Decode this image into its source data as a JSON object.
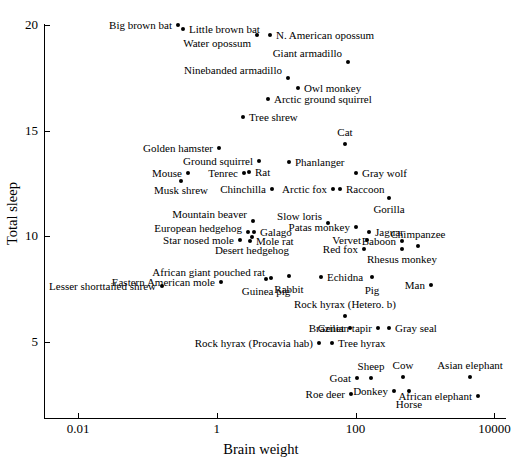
{
  "chart_data": {
    "type": "scatter",
    "title": "",
    "xlabel": "Brain weight",
    "ylabel": "Total sleep",
    "xscale": "log",
    "yscale": "linear",
    "xlim": [
      0.0018,
      12000
    ],
    "ylim": [
      2.5,
      20.5
    ],
    "grid": false,
    "legend": null,
    "xticks": [
      "0.01",
      "1",
      "100",
      "10000"
    ],
    "xtick_values": [
      0.01,
      1,
      100,
      10000
    ],
    "yticks": [
      "20",
      "15",
      "10",
      "5"
    ],
    "ytick_values": [
      20,
      15,
      10,
      5
    ],
    "points": [
      {
        "label": "Big brown bat",
        "x": 0.3,
        "y": 19.9,
        "px": 178,
        "py": 25,
        "lx": 172,
        "ly": 25,
        "lpos": "left"
      },
      {
        "label": "Little brown bat",
        "x": 0.4,
        "y": 19.7,
        "px": 183,
        "py": 29,
        "lx": 189,
        "ly": 29,
        "lpos": "right"
      },
      {
        "label": "Water opossum",
        "x": 3.9,
        "y": 19.4,
        "px": 257,
        "py": 35,
        "lx": 251,
        "ly": 43,
        "lpos": "left"
      },
      {
        "label": "N. American opossum",
        "x": 6.3,
        "y": 19.4,
        "px": 270,
        "py": 35,
        "lx": 276,
        "ly": 35,
        "lpos": "right"
      },
      {
        "label": "Giant armadillo",
        "x": 81,
        "y": 18.1,
        "px": 348,
        "py": 62,
        "lx": 342,
        "ly": 53,
        "lpos": "left"
      },
      {
        "label": "Ninebanded armadillo",
        "x": 10.8,
        "y": 17.4,
        "px": 288,
        "py": 78,
        "lx": 282,
        "ly": 70,
        "lpos": "left"
      },
      {
        "label": "Owl monkey",
        "x": 15.5,
        "y": 17.0,
        "px": 298,
        "py": 88,
        "lx": 304,
        "ly": 88,
        "lpos": "right"
      },
      {
        "label": "Arctic ground squirrel",
        "x": 5.7,
        "y": 16.6,
        "px": 268,
        "py": 99,
        "lx": 274,
        "ly": 99,
        "lpos": "right"
      },
      {
        "label": "Tree shrew",
        "x": 2.5,
        "y": 15.8,
        "px": 243,
        "py": 117,
        "lx": 249,
        "ly": 117,
        "lpos": "right"
      },
      {
        "label": "Cat",
        "x": 25.6,
        "y": 14.5,
        "px": 345,
        "py": 144,
        "lx": 345,
        "ly": 138,
        "lpos": "above"
      },
      {
        "label": "Golden hamster",
        "x": 1.0,
        "y": 14.3,
        "px": 219,
        "py": 148,
        "lx": 213,
        "ly": 148,
        "lpos": "left"
      },
      {
        "label": "Ground squirrel",
        "x": 4.0,
        "y": 13.8,
        "px": 259,
        "py": 161,
        "lx": 253,
        "ly": 161,
        "lpos": "left"
      },
      {
        "label": "Phanlanger",
        "x": 11.4,
        "y": 13.7,
        "px": 289,
        "py": 162,
        "lx": 295,
        "ly": 162,
        "lpos": "right"
      },
      {
        "label": "Gray wolf",
        "x": 119.5,
        "y": 13.3,
        "px": 356,
        "py": 173,
        "lx": 362,
        "ly": 173,
        "lpos": "right"
      },
      {
        "label": "Mouse",
        "x": 0.4,
        "y": 12.8,
        "px": 188,
        "py": 173,
        "lx": 182,
        "ly": 173,
        "lpos": "left"
      },
      {
        "label": "Tenrec",
        "x": 2.6,
        "y": 12.8,
        "px": 244,
        "py": 173,
        "lx": 238,
        "ly": 173,
        "lpos": "left"
      },
      {
        "label": "Rat",
        "x": 1.9,
        "y": 13.0,
        "px": 249,
        "py": 172,
        "lx": 255,
        "ly": 172,
        "lpos": "right"
      },
      {
        "label": "Musk shrew",
        "x": 0.33,
        "y": 12.5,
        "px": 181,
        "py": 181,
        "lx": 181,
        "ly": 185,
        "lpos": "below"
      },
      {
        "label": "Chinchilla",
        "x": 6.4,
        "y": 12.5,
        "px": 272,
        "py": 189,
        "lx": 266,
        "ly": 189,
        "lpos": "left"
      },
      {
        "label": "Arctic fox",
        "x": 44.5,
        "y": 12.5,
        "px": 333,
        "py": 189,
        "lx": 327,
        "ly": 189,
        "lpos": "left"
      },
      {
        "label": "Raccoon",
        "x": 39.2,
        "y": 12.5,
        "px": 340,
        "py": 189,
        "lx": 346,
        "ly": 189,
        "lpos": "right"
      },
      {
        "label": "Gorilla",
        "x": 406,
        "y": 12.0,
        "px": 389,
        "py": 198,
        "lx": 389,
        "ly": 204,
        "lpos": "below"
      },
      {
        "label": "Mountain beaver",
        "x": 8.1,
        "y": 14.4,
        "px": 253,
        "py": 221,
        "lx": 247,
        "ly": 214,
        "lpos": "left"
      },
      {
        "label": "Slow loris",
        "x": 12.5,
        "y": 11.0,
        "px": 328,
        "py": 223,
        "lx": 322,
        "ly": 216,
        "lpos": "left"
      },
      {
        "label": "European hedgehog",
        "x": 3.5,
        "y": 10.8,
        "px": 248,
        "py": 232,
        "lx": 242,
        "ly": 228,
        "lpos": "left"
      },
      {
        "label": "Galago",
        "x": 5.0,
        "y": 10.8,
        "px": 254,
        "py": 232,
        "lx": 260,
        "ly": 232,
        "lpos": "right"
      },
      {
        "label": "Patas monkey",
        "x": 115,
        "y": 10.9,
        "px": 356,
        "py": 227,
        "lx": 350,
        "ly": 227,
        "lpos": "left"
      },
      {
        "label": "Jaguar",
        "x": 157,
        "y": 10.8,
        "px": 369,
        "py": 232,
        "lx": 375,
        "ly": 232,
        "lpos": "right"
      },
      {
        "label": "Star nosed mole",
        "x": 1.0,
        "y": 10.3,
        "px": 240,
        "py": 240,
        "lx": 234,
        "ly": 240,
        "lpos": "left"
      },
      {
        "label": "Mole rat",
        "x": 3.0,
        "y": 10.6,
        "px": 250,
        "py": 241,
        "lx": 256,
        "ly": 241,
        "lpos": "right"
      },
      {
        "label": "Desert hedgehog",
        "x": 2.4,
        "y": 10.3,
        "px": 252,
        "py": 237,
        "lx": 252,
        "ly": 245,
        "lpos": "below"
      },
      {
        "label": "Vervet",
        "x": 58,
        "y": 10.3,
        "px": 367,
        "py": 240,
        "lx": 361,
        "ly": 240,
        "lpos": "left"
      },
      {
        "label": "Baboon",
        "x": 179.5,
        "y": 10.3,
        "px": 402,
        "py": 241,
        "lx": 396,
        "ly": 241,
        "lpos": "left"
      },
      {
        "label": "Chimpanzee",
        "x": 440,
        "y": 10.3,
        "px": 418,
        "py": 246,
        "lx": 418,
        "ly": 240,
        "lpos": "above"
      },
      {
        "label": "Red fox",
        "x": 50.4,
        "y": 9.8,
        "px": 364,
        "py": 249,
        "lx": 358,
        "ly": 249,
        "lpos": "left"
      },
      {
        "label": "Rhesus monkey",
        "x": 179,
        "y": 9.8,
        "px": 402,
        "py": 249,
        "lx": 402,
        "ly": 254,
        "lpos": "below"
      },
      {
        "label": "Lesser shorttailed shrew",
        "x": 0.14,
        "y": 8.4,
        "px": 162,
        "py": 286,
        "lx": 156,
        "ly": 286,
        "lpos": "left"
      },
      {
        "label": "African giant pouched rat",
        "x": 6.6,
        "y": 8.3,
        "px": 271,
        "py": 278,
        "lx": 265,
        "ly": 272,
        "lpos": "left"
      },
      {
        "label": "Eastern American mole",
        "x": 1.2,
        "y": 8.4,
        "px": 221,
        "py": 282,
        "lx": 215,
        "ly": 282,
        "lpos": "left"
      },
      {
        "label": "Guinea pig",
        "x": 5.5,
        "y": 8.2,
        "px": 266,
        "py": 279,
        "lx": 266,
        "ly": 286,
        "lpos": "below"
      },
      {
        "label": "Rabbit",
        "x": 12.1,
        "y": 8.4,
        "px": 289,
        "py": 276,
        "lx": 289,
        "ly": 284,
        "lpos": "below"
      },
      {
        "label": "Echidna",
        "x": 25,
        "y": 8.6,
        "px": 321,
        "py": 277,
        "lx": 327,
        "ly": 277,
        "lpos": "right"
      },
      {
        "label": "Pig",
        "x": 180,
        "y": 8.4,
        "px": 372,
        "py": 277,
        "lx": 372,
        "ly": 285,
        "lpos": "below"
      },
      {
        "label": "Man",
        "x": 1320,
        "y": 8.0,
        "px": 431,
        "py": 285,
        "lx": 425,
        "ly": 285,
        "lpos": "left"
      },
      {
        "label": "Rock hyrax (Hetero. b)",
        "x": 12.3,
        "y": 6.6,
        "px": 345,
        "py": 316,
        "lx": 345,
        "ly": 310,
        "lpos": "above"
      },
      {
        "label": "Genet",
        "x": 17.5,
        "y": 6.3,
        "px": 350,
        "py": 328,
        "lx": 344,
        "ly": 328,
        "lpos": "left"
      },
      {
        "label": "Brazilian tapir",
        "x": 169,
        "y": 6.2,
        "px": 378,
        "py": 328,
        "lx": 372,
        "ly": 328,
        "lpos": "left"
      },
      {
        "label": "Gray seal",
        "x": 325,
        "y": 6.2,
        "px": 389,
        "py": 328,
        "lx": 395,
        "ly": 328,
        "lpos": "right"
      },
      {
        "label": "Rock hyrax (Procavia hab)",
        "x": 21,
        "y": 5.4,
        "px": 319,
        "py": 343,
        "lx": 313,
        "ly": 343,
        "lpos": "left"
      },
      {
        "label": "Tree hyrax",
        "x": 12.3,
        "y": 5.4,
        "px": 332,
        "py": 343,
        "lx": 338,
        "ly": 343,
        "lpos": "right"
      },
      {
        "label": "Goat",
        "x": 115,
        "y": 3.9,
        "px": 357,
        "py": 378,
        "lx": 351,
        "ly": 378,
        "lpos": "left"
      },
      {
        "label": "Sheep",
        "x": 175,
        "y": 3.8,
        "px": 371,
        "py": 378,
        "lx": 371,
        "ly": 372,
        "lpos": "above"
      },
      {
        "label": "Cow",
        "x": 423,
        "y": 3.9,
        "px": 403,
        "py": 377,
        "lx": 403,
        "ly": 371,
        "lpos": "above"
      },
      {
        "label": "Asian elephant",
        "x": 4603,
        "y": 3.9,
        "px": 470,
        "py": 377,
        "lx": 470,
        "ly": 371,
        "lpos": "above"
      },
      {
        "label": "Donkey",
        "x": 419,
        "y": 3.1,
        "px": 394,
        "py": 391,
        "lx": 388,
        "ly": 391,
        "lpos": "left"
      },
      {
        "label": "African elephant",
        "x": 5712,
        "y": 3.3,
        "px": 478,
        "py": 396,
        "lx": 472,
        "ly": 396,
        "lpos": "left"
      },
      {
        "label": "Horse",
        "x": 655,
        "y": 2.9,
        "px": 409,
        "py": 391,
        "lx": 409,
        "ly": 399,
        "lpos": "below"
      },
      {
        "label": "Roe deer",
        "x": 98.2,
        "y": 3.0,
        "px": 351,
        "py": 394,
        "lx": 345,
        "ly": 394,
        "lpos": "left"
      }
    ]
  },
  "colors": {
    "axis": "#000000",
    "point": "#000000",
    "background": "#ffffff"
  }
}
